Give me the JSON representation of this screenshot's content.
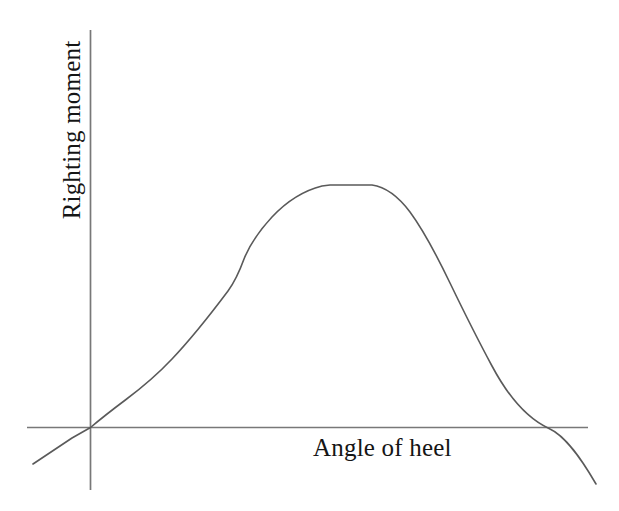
{
  "figure": {
    "background_color": "#ffffff",
    "width": 619,
    "height": 511
  },
  "axes": {
    "x_axis": {
      "label": "Angle of heel",
      "color": "#787878",
      "x_start": 27,
      "x_end": 588,
      "y": 427.5
    },
    "y_axis": {
      "label": "Righting moment",
      "color": "#787878",
      "x": 90.5,
      "y_start": 30,
      "y_end": 490
    }
  },
  "curve": {
    "color": "#5a5a5a",
    "width": 1.6,
    "path": "M 33,464 L 72,438 L 90.5,427.5 C 104,416 116,407 126,399.5 C 140,389 156,376 172,359 C 190,340 210,315 228,291 C 236,280 240,270 244,259 C 250,244 260,230 272,217 C 288,200 306,190 322,186 L 330,185 L 372,185 C 386,187 398,196 410,212 C 424,231 437,256 450,283 C 464,312 478,340 492,366 C 508,396 528,419 549,428.5 C 566,436 582,460 596,484"
  },
  "chart_data": {
    "type": "line",
    "title": "",
    "xlabel": "Angle of heel",
    "ylabel": "Righting moment",
    "grid": false,
    "legend": "none",
    "xlim": [
      -12,
      110
    ],
    "ylim": [
      -22,
      105
    ],
    "axis_tick_labels": {
      "x": [],
      "y": []
    },
    "annotations": [],
    "series": [
      {
        "name": "Righting moment curve",
        "x": [
          -12,
          -4,
          0,
          8,
          15,
          22,
          30,
          38,
          45,
          50,
          55,
          62,
          68,
          75,
          80,
          86,
          92,
          97,
          100,
          105,
          110
        ],
        "y": [
          -8,
          -3,
          0,
          6,
          12,
          19,
          29,
          42,
          53,
          60,
          68,
          78,
          86,
          88,
          88,
          84,
          74,
          60,
          48,
          22,
          -10
        ]
      }
    ],
    "features": {
      "origin_crossing_x": 0,
      "second_zero_crossing_x": 102,
      "peak_plateau_x_range": [
        70,
        80
      ],
      "peak_value_relative": 88,
      "notes": "Monotonic rise from origin to a flat-topped maximum, then a steeper decline through a second zero crossing into negative righting moment."
    }
  }
}
